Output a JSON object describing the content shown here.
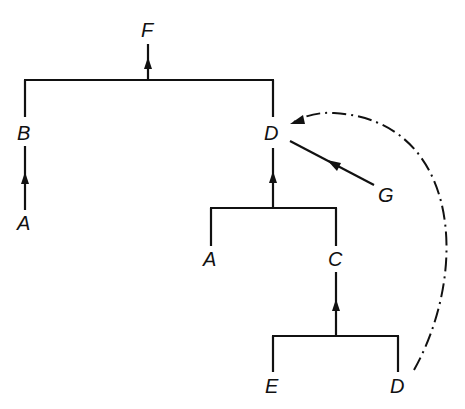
{
  "diagram": {
    "type": "tree",
    "nodes": {
      "root": "F",
      "left_child": "B",
      "left_grandchild": "A",
      "right_child": "D",
      "right_sub_left": "A",
      "right_sub_right": "C",
      "bottom_left": "E",
      "bottom_right": "D",
      "side_node": "G"
    },
    "edges": [
      {
        "from": "B",
        "to": "F",
        "style": "solid"
      },
      {
        "from": "D",
        "to": "F",
        "style": "solid"
      },
      {
        "from": "A",
        "to": "B",
        "style": "solid-arrow"
      },
      {
        "from": "A",
        "to": "D",
        "style": "solid"
      },
      {
        "from": "C",
        "to": "D",
        "style": "solid-arrow"
      },
      {
        "from": "E",
        "to": "C",
        "style": "solid"
      },
      {
        "from": "D",
        "to": "C",
        "style": "solid-arrow"
      },
      {
        "from": "G",
        "to": "D",
        "style": "solid-arrow"
      },
      {
        "from": "D (bottom)",
        "to": "D (top)",
        "style": "dash-dot-arrow"
      }
    ]
  }
}
